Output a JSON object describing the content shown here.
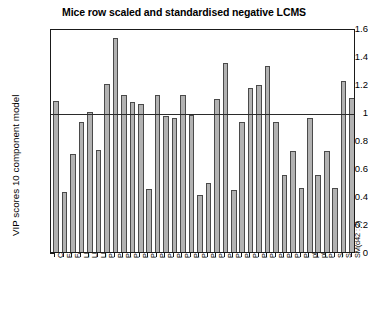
{
  "chart_data": {
    "type": "bar",
    "title": "Mice row scaled and standardised negative LCMS",
    "xlabel": "",
    "ylabel": "VIP scores 10 component model",
    "ylim": [
      0,
      1.6
    ],
    "yticks": [
      0,
      0.2,
      0.4,
      0.6,
      0.8,
      1,
      1.2,
      1.4,
      1.6
    ],
    "ytick_labels": [
      "0",
      "0.2",
      "0.4",
      "0.6",
      "0.8",
      "1",
      "1.2",
      "1.4",
      "1.6"
    ],
    "grid": false,
    "legend": null,
    "reference_line": {
      "orientation": "horizontal",
      "value": 1,
      "color": "#2b2b2b"
    },
    "bar_color": "#b2b2b2",
    "bar_edge_color": "#4a4a4a",
    "categories": [
      "Cer(d42 : 2)",
      "FA(18 : 1)",
      "FA(18 : 2)",
      "LPC(16 : 0)",
      "LPC(18 : 1)",
      "LPC(18 : 2)",
      "PC(34 : 2)",
      "PC(35 : 2)",
      "PC(36 : 4)bis",
      "PC(36 : 4)",
      "PC(38 : 4)",
      "PC(38 : 5)",
      "PC(38 : 6)",
      "PC(40 : 6)",
      "PC(40 : 8)",
      "PE(34 : 2)",
      "PE(34 : 4)",
      "PE(38 : 6)",
      "PE(34 : 4)",
      "PE(38 : 6)",
      "PE(40 : 4)",
      "PG(36 : 1)",
      "PI(34 : 2)",
      "PI(36 : 2)",
      "PI(36 : 4)",
      "PI(38 : 4)",
      "PI(38 : 5)",
      "PI(38 : 4)",
      "PI(38 : 5)",
      "PI(40 : 6)",
      "plas(34 : 4)",
      "plas(38 : 6)",
      "PS(42 : 8)",
      "SM(d34 : 1)",
      "SM(d34 : 2)",
      "SM(d42 : 2)"
    ],
    "values": [
      1.08,
      0.43,
      0.7,
      0.93,
      1.0,
      0.73,
      1.2,
      1.53,
      1.12,
      1.07,
      1.06,
      0.45,
      1.12,
      0.97,
      0.96,
      1.12,
      0.98,
      0.41,
      0.49,
      1.09,
      1.35,
      0.44,
      0.93,
      1.17,
      1.19,
      1.33,
      0.93,
      0.55,
      0.72,
      0.46,
      0.96,
      0.55,
      0.72,
      0.46,
      1.22,
      1.1
    ]
  }
}
